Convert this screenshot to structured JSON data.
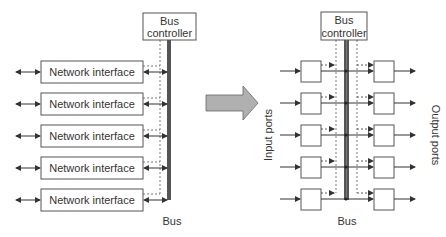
{
  "left": {
    "controller_line1": "Bus",
    "controller_line2": "controller",
    "bus_label": "Bus",
    "interfaces": [
      "Network interface",
      "Network interface",
      "Network interface",
      "Network interface",
      "Network interface"
    ]
  },
  "right": {
    "controller_line1": "Bus",
    "controller_line2": "controller",
    "bus_label": "Bus",
    "input_label": "Input ports",
    "output_label": "Output ports"
  },
  "colors": {
    "line": "#333333",
    "bus": "#555555",
    "arrow_fill": "#b0b0b0"
  }
}
